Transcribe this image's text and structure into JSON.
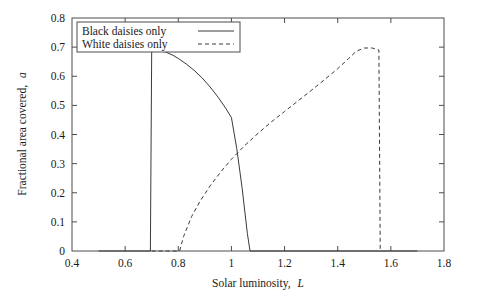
{
  "chart_data": {
    "type": "line",
    "title": "",
    "xlabel": "Solar luminosity, L",
    "xlabel_main": "Solar luminosity,",
    "xlabel_sym": "L",
    "ylabel": "Fractional area covered, a",
    "ylabel_main": "Fractional area covered,",
    "ylabel_sym": "a",
    "xlim": [
      0.4,
      1.8
    ],
    "ylim": [
      0.0,
      0.8
    ],
    "xticks": [
      0.4,
      0.6,
      0.8,
      1.0,
      1.2,
      1.4,
      1.6,
      1.8
    ],
    "xticklabels": [
      "0.4",
      "0.6",
      "0.8",
      "1",
      "1.2",
      "1.4",
      "1.6",
      "1.8"
    ],
    "yticks": [
      0.0,
      0.1,
      0.2,
      0.3,
      0.4,
      0.5,
      0.6,
      0.7,
      0.8
    ],
    "yticklabels": [
      "0",
      "0.1",
      "0.2",
      "0.3",
      "0.4",
      "0.5",
      "0.6",
      "0.7",
      "0.8"
    ],
    "grid": false,
    "legend_position": "top-left",
    "line_color": "#3a3a3a",
    "frame_color": "#4d4d4d",
    "series": [
      {
        "name": "Black daisies only",
        "style": "solid",
        "points": [
          [
            0.5,
            0.0
          ],
          [
            0.6,
            0.0
          ],
          [
            0.695,
            0.0
          ],
          [
            0.7,
            0.695
          ],
          [
            0.72,
            0.692
          ],
          [
            0.75,
            0.684
          ],
          [
            0.78,
            0.672
          ],
          [
            0.8,
            0.661
          ],
          [
            0.83,
            0.642
          ],
          [
            0.86,
            0.62
          ],
          [
            0.89,
            0.594
          ],
          [
            0.92,
            0.563
          ],
          [
            0.95,
            0.528
          ],
          [
            0.98,
            0.488
          ],
          [
            1.0,
            0.458
          ],
          [
            1.02,
            0.352
          ],
          [
            1.04,
            0.218
          ],
          [
            1.06,
            0.06
          ],
          [
            1.07,
            0.0
          ],
          [
            1.2,
            0.0
          ],
          [
            1.4,
            0.0
          ],
          [
            1.6,
            0.0
          ],
          [
            1.7,
            0.0
          ]
        ]
      },
      {
        "name": "White daisies only",
        "style": "dashed",
        "points": [
          [
            0.7,
            0.0
          ],
          [
            0.76,
            0.0
          ],
          [
            0.805,
            0.0
          ],
          [
            0.82,
            0.05
          ],
          [
            0.85,
            0.118
          ],
          [
            0.88,
            0.168
          ],
          [
            0.92,
            0.224
          ],
          [
            0.96,
            0.272
          ],
          [
            1.0,
            0.315
          ],
          [
            1.05,
            0.362
          ],
          [
            1.1,
            0.404
          ],
          [
            1.15,
            0.443
          ],
          [
            1.2,
            0.479
          ],
          [
            1.25,
            0.515
          ],
          [
            1.3,
            0.551
          ],
          [
            1.35,
            0.588
          ],
          [
            1.4,
            0.626
          ],
          [
            1.44,
            0.66
          ],
          [
            1.47,
            0.686
          ],
          [
            1.5,
            0.697
          ],
          [
            1.53,
            0.697
          ],
          [
            1.555,
            0.69
          ],
          [
            1.56,
            0.0
          ]
        ]
      }
    ],
    "annotations": {
      "crossing_point": [
        1.18,
        0.26
      ],
      "black_peak": [
        0.7,
        0.695
      ],
      "white_peak": [
        1.5,
        0.697
      ]
    }
  },
  "legend": {
    "entries": [
      {
        "label": "Black daisies only",
        "style": "solid"
      },
      {
        "label": "White daisies only",
        "style": "dashed"
      }
    ]
  }
}
